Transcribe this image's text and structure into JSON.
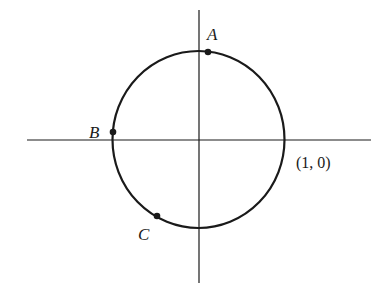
{
  "diagram": {
    "type": "unit-circle",
    "colors": {
      "stroke": "#1a1a1a",
      "background": "#ffffff"
    },
    "axes": {
      "horizontal": {
        "x1": 27,
        "x2": 371,
        "y": 140
      },
      "vertical": {
        "x": 199,
        "y1": 10,
        "y2": 283
      }
    },
    "circle": {
      "cx": 198.5,
      "cy": 139.5,
      "rx": 86,
      "ry": 88.5
    },
    "points": [
      {
        "name": "A",
        "label": "A",
        "x": 208,
        "y": 52,
        "label_x": 207,
        "label_y": 40
      },
      {
        "name": "B",
        "label": "B",
        "x": 113,
        "y": 132,
        "label_x": 89,
        "label_y": 138
      },
      {
        "name": "C",
        "label": "C",
        "x": 157,
        "y": 216,
        "label_x": 138,
        "label_y": 240
      }
    ],
    "coordinate_label": {
      "text": "(1, 0)",
      "x": 296,
      "y": 168
    }
  }
}
